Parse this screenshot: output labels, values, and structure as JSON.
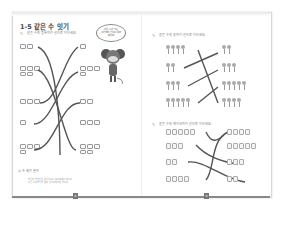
{
  "left_page": {
    "title": "1-5 같은 수 잇기",
    "instruction": "같은 수의 블록끼리 선으로 이으세요.",
    "speech_bubble": [
      "같은 수가 있는",
      "그림끼리 선으로 이어",
      "봅시다!"
    ],
    "blocks_left": [
      2,
      5,
      3,
      1,
      4
    ],
    "blocks_right": [
      1,
      4,
      2,
      3,
      5
    ],
    "tip_label": "수 세기 놀이",
    "tip_lines": [
      "블록이 몇 개인지 손가락으로 짚으며 세어 봅시다.",
      "같은 수의 블록을 찾아 선으로 이으면 됩니다."
    ],
    "page_number": "8"
  },
  "right_page": {
    "instruction_flowers": "같은 수의 꽃끼리 선으로 이으세요.",
    "flowers_left": [
      4,
      2,
      3,
      5
    ],
    "flowers_right": [
      2,
      3,
      5,
      4
    ],
    "instruction_cakes": "같은 수의 케이크끼리 선으로 이으세요.",
    "cakes_left": [
      5,
      3,
      2,
      4
    ],
    "cakes_right": [
      4,
      5,
      3,
      2
    ],
    "page_number": "9"
  },
  "colors": {
    "line": "#555555",
    "block": "#999999",
    "footer": "#888888"
  }
}
